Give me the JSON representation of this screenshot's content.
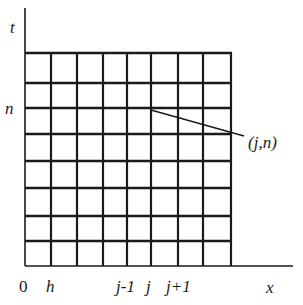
{
  "diagram": {
    "title": "",
    "axes": {
      "t_label": "t",
      "x_label": "x",
      "origin_label": "0"
    },
    "y_labels": {
      "n": "n"
    },
    "x_labels": {
      "h": "h",
      "j_minus_1": "j-1",
      "j": "j",
      "j_plus_1": "j+1"
    },
    "annotation": {
      "point_label": "(j,n)"
    },
    "grid": {
      "columns": 8,
      "rows": 8,
      "x_lines": [
        25,
        51,
        77,
        103,
        127,
        151,
        178,
        203,
        231
      ],
      "y_lines": [
        53,
        83,
        108,
        134,
        161,
        188,
        216,
        241,
        266
      ]
    },
    "colors": {
      "line": "#1a1a1a",
      "background": "#ffffff"
    }
  }
}
